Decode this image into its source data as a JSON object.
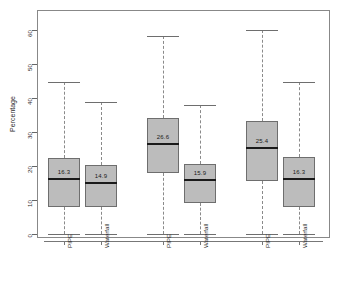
{
  "chart_data": {
    "type": "box",
    "title": "",
    "xlabel": "",
    "ylabel": "Percentage",
    "ylim": [
      0,
      62
    ],
    "yticks": [
      0,
      10,
      20,
      30,
      40,
      50,
      60
    ],
    "ytick_labels": [
      "0",
      "10",
      "20",
      "30",
      "40",
      "50",
      "60"
    ],
    "grid": false,
    "legend": null,
    "panels": [
      {
        "title": "(i)"
      },
      {
        "title": "(ii)"
      },
      {
        "title": "(iii)"
      }
    ],
    "categories": [
      "PIPE",
      "Waterfall",
      "PIPE",
      "Waterfall",
      "PIPE",
      "Waterfall"
    ],
    "boxes": [
      {
        "panel": "(i)",
        "label": "PIPE",
        "whisker_low": 0.0,
        "q1": 7.8,
        "median": 16.3,
        "q3": 22.4,
        "whisker_high": 44.7,
        "median_label": "16.3"
      },
      {
        "panel": "(i)",
        "label": "Waterfall",
        "whisker_low": 0.0,
        "q1": 7.8,
        "median": 14.9,
        "q3": 20.3,
        "whisker_high": 38.9,
        "median_label": "14.9"
      },
      {
        "panel": "(ii)",
        "label": "PIPE",
        "whisker_low": 0.0,
        "q1": 18.0,
        "median": 26.6,
        "q3": 34.0,
        "whisker_high": 58.2,
        "median_label": "26.6"
      },
      {
        "panel": "(ii)",
        "label": "Waterfall",
        "whisker_low": 0.0,
        "q1": 9.2,
        "median": 15.9,
        "q3": 20.6,
        "whisker_high": 38.0,
        "median_label": "15.9"
      },
      {
        "panel": "(iii)",
        "label": "PIPE",
        "whisker_low": 0.0,
        "q1": 15.5,
        "median": 25.4,
        "q3": 33.2,
        "whisker_high": 60.0,
        "median_label": "25.4"
      },
      {
        "panel": "(iii)",
        "label": "Waterfall",
        "whisker_low": 0.0,
        "q1": 7.8,
        "median": 16.3,
        "q3": 22.7,
        "whisker_high": 44.7,
        "median_label": "16.3"
      }
    ],
    "colors": {
      "box_fill": "#bcbcbc",
      "box_border": "#6e6e6e",
      "median": "#1a1a1a",
      "whisker": "#8a8a8a",
      "axis": "#777777",
      "frame": "#888888",
      "text": "#2b2b2b",
      "background": "#ffffff"
    }
  }
}
